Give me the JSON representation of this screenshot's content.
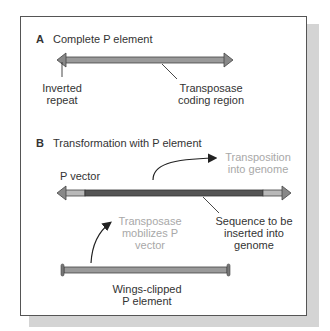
{
  "panel_a": {
    "letter": "A",
    "title": "Complete P element",
    "labels": {
      "inverted_repeat_line1": "Inverted",
      "inverted_repeat_line2": "repeat",
      "coding_line1": "Transposase",
      "coding_line2": "coding region"
    }
  },
  "panel_b": {
    "letter": "B",
    "title": "Transformation with P element",
    "p_vector_label": "P vector",
    "transposition_line1": "Transposition",
    "transposition_line2": "into genome",
    "sequence_line1": "Sequence to be",
    "sequence_line2": "inserted into",
    "sequence_line3": "genome",
    "mobilizes_line1": "Transposase",
    "mobilizes_line2": "mobilizes P",
    "mobilizes_line3": "vector",
    "wings_line1": "Wings-clipped",
    "wings_line2": "P element"
  },
  "colors": {
    "element_fill": "#9a9a9a",
    "insert_fill": "#555555",
    "end_fill": "#b8b8b8",
    "faded_text": "#a8a8a8",
    "border": "#555555",
    "shadow": "#d4d4d4"
  }
}
